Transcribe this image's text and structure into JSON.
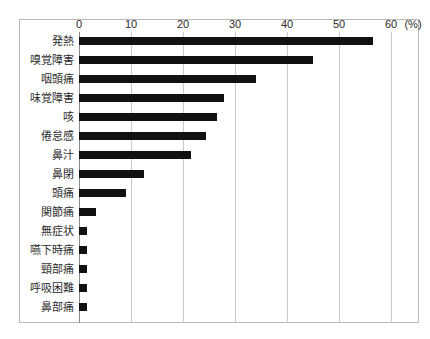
{
  "chart_data": {
    "type": "bar",
    "orientation": "horizontal",
    "title": "",
    "xlabel": "(%)",
    "ylabel": "",
    "xlim": [
      0,
      60
    ],
    "xticks": [
      0,
      10,
      20,
      30,
      40,
      50,
      60
    ],
    "xtick_labels": [
      "0",
      "10",
      "20",
      "30",
      "40",
      "50",
      "60"
    ],
    "unit_label": "(%)",
    "grid": true,
    "legend": false,
    "bar_color": "#111111",
    "categories": [
      "発熱",
      "嗅覚障害",
      "咽頭痛",
      "味覚障害",
      "咳",
      "倦怠感",
      "鼻汁",
      "鼻閉",
      "頭痛",
      "関節痛",
      "無症状",
      "嚥下時痛",
      "頸部痛",
      "呼吸困難",
      "鼻部痛"
    ],
    "values": [
      56.5,
      45.0,
      34.0,
      27.9,
      26.5,
      24.4,
      21.5,
      12.5,
      9.0,
      3.3,
      1.6,
      1.6,
      1.6,
      1.6,
      1.6
    ]
  }
}
